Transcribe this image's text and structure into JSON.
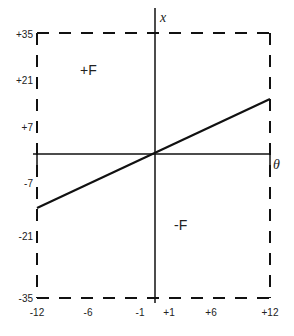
{
  "diagram": {
    "axes": {
      "vertical_label": "x",
      "horizontal_label": "θ"
    },
    "y_ticks": [
      "+35",
      "+21",
      "+7",
      "-7",
      "-21",
      "-35"
    ],
    "x_ticks": [
      "-12",
      "-6",
      "-1",
      "+1",
      "+6",
      "+12"
    ],
    "regions": {
      "upper_left": "+F",
      "lower_right": "-F"
    },
    "colors": {
      "stroke": "#111111",
      "text": "#222222",
      "background": "#ffffff"
    }
  }
}
